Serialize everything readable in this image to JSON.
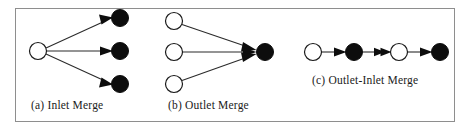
{
  "figure": {
    "width": 471,
    "height": 131,
    "background_color": "#ffffff",
    "border_color": "#8e8e8e",
    "node_stroke_color": "#1a1a1a",
    "node_fill_open": "#ffffff",
    "node_fill_filled": "#0d0d0d",
    "edge_color": "#2b2b2b"
  },
  "panels": [
    {
      "id": "a",
      "caption": "(a) Inlet Merge",
      "nodes": [
        {
          "name": "a-source",
          "type": "open",
          "cx": 38,
          "cy": 51,
          "r": 8.5
        },
        {
          "name": "a-target-top",
          "type": "filled",
          "cx": 120,
          "cy": 18,
          "r": 8.5
        },
        {
          "name": "a-target-mid",
          "type": "filled",
          "cx": 120,
          "cy": 51,
          "r": 8.5
        },
        {
          "name": "a-target-bottom",
          "type": "filled",
          "cx": 120,
          "cy": 84,
          "r": 8.5
        }
      ],
      "edges": [
        {
          "name": "a-edge-top",
          "from": "a-source",
          "to": "a-target-top",
          "arrow": "single"
        },
        {
          "name": "a-edge-mid",
          "from": "a-source",
          "to": "a-target-mid",
          "arrow": "single"
        },
        {
          "name": "a-edge-bottom",
          "from": "a-source",
          "to": "a-target-bottom",
          "arrow": "single"
        }
      ]
    },
    {
      "id": "b",
      "caption": "(b) Outlet Merge",
      "nodes": [
        {
          "name": "b-source-top",
          "type": "open",
          "cx": 174,
          "cy": 21,
          "r": 8.5
        },
        {
          "name": "b-source-mid",
          "type": "open",
          "cx": 174,
          "cy": 52,
          "r": 8.5
        },
        {
          "name": "b-source-bottom",
          "type": "open",
          "cx": 174,
          "cy": 84,
          "r": 8.5
        },
        {
          "name": "b-target",
          "type": "filled",
          "cx": 265,
          "cy": 52,
          "r": 8.5
        }
      ],
      "edges": [
        {
          "name": "b-edge-top",
          "from": "b-source-top",
          "to": "b-target",
          "arrow": "single"
        },
        {
          "name": "b-edge-mid",
          "from": "b-source-mid",
          "to": "b-target",
          "arrow": "single"
        },
        {
          "name": "b-edge-bottom",
          "from": "b-source-bottom",
          "to": "b-target",
          "arrow": "single"
        }
      ]
    },
    {
      "id": "c",
      "caption": "(c) Outlet-Inlet Merge",
      "nodes": [
        {
          "name": "c-node-1",
          "type": "open",
          "cx": 313,
          "cy": 52,
          "r": 8.5
        },
        {
          "name": "c-node-2",
          "type": "filled",
          "cx": 354,
          "cy": 52,
          "r": 8.5
        },
        {
          "name": "c-node-3",
          "type": "open",
          "cx": 399,
          "cy": 52,
          "r": 8.5
        },
        {
          "name": "c-node-4",
          "type": "filled",
          "cx": 440,
          "cy": 52,
          "r": 8.5
        }
      ],
      "edges": [
        {
          "name": "c-edge-1",
          "from": "c-node-1",
          "to": "c-node-2",
          "arrow": "single"
        },
        {
          "name": "c-edge-2",
          "from": "c-node-2",
          "to": "c-node-3",
          "arrow": "double"
        },
        {
          "name": "c-edge-3",
          "from": "c-node-3",
          "to": "c-node-4",
          "arrow": "single"
        }
      ]
    }
  ]
}
